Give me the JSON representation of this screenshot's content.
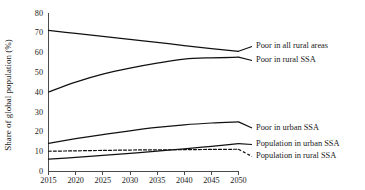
{
  "chart_data": {
    "type": "line",
    "title": "",
    "xlabel": "",
    "ylabel": "Share of global population (%)",
    "xlim": [
      2015,
      2050
    ],
    "ylim": [
      0,
      80
    ],
    "grid": false,
    "legend_position": "right-inline",
    "x": [
      2015,
      2020,
      2025,
      2030,
      2035,
      2040,
      2045,
      2050
    ],
    "xticklabels": [
      "2015",
      "2020",
      "2025",
      "2030",
      "2035",
      "2040",
      "2045",
      "2050"
    ],
    "yticks": [
      0,
      10,
      20,
      30,
      40,
      50,
      60,
      70,
      80
    ],
    "yticklabels": [
      "0",
      "10",
      "20",
      "30",
      "40",
      "50",
      "60",
      "70",
      "80"
    ],
    "series": [
      {
        "name": "Poor in all rural areas",
        "style": "solid",
        "color": "#111111",
        "values": [
          71.0,
          69.5,
          68.0,
          66.5,
          65.0,
          63.3,
          61.8,
          60.5
        ]
      },
      {
        "name": "Poor in rural SSA",
        "style": "solid",
        "color": "#111111",
        "values": [
          40.0,
          45.0,
          49.0,
          52.0,
          54.5,
          56.5,
          57.2,
          57.5
        ]
      },
      {
        "name": "Poor in urban SSA",
        "style": "solid",
        "color": "#111111",
        "values": [
          14.2,
          16.5,
          18.6,
          20.5,
          22.2,
          23.5,
          24.4,
          25.0
        ]
      },
      {
        "name": "Population in urban SSA",
        "style": "solid",
        "color": "#111111",
        "values": [
          6.2,
          7.1,
          8.1,
          9.1,
          10.2,
          11.4,
          12.7,
          14.0
        ]
      },
      {
        "name": "Population in rural SSA",
        "style": "dashed",
        "color": "#111111",
        "values": [
          10.2,
          10.4,
          10.6,
          10.8,
          10.9,
          11.0,
          11.1,
          11.2
        ]
      }
    ],
    "legend_entries": [
      {
        "label": "Poor in all rural areas",
        "style": "solid"
      },
      {
        "label": "Poor in rural SSA",
        "style": "solid"
      },
      {
        "label": "Poor in urban SSA",
        "style": "solid"
      },
      {
        "label": "Population in urban SSA",
        "style": "solid"
      },
      {
        "label": "Population in rural SSA",
        "style": "dashed"
      }
    ]
  }
}
